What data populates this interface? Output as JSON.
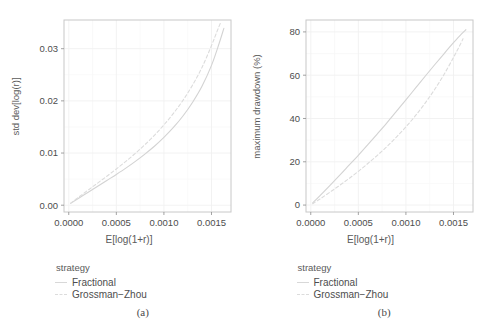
{
  "figure": {
    "background": "#ffffff",
    "line_color_solid": "#d3d3d3",
    "line_color_dashed": "#dcdcdc",
    "grid_color": "#f0f0f0",
    "panel_border_color": "#c8c8c8",
    "text_color": "#4a4a4a"
  },
  "panels": [
    {
      "caption": "(a)",
      "legend": {
        "title": "strategy",
        "items": [
          {
            "label": "Fractional",
            "style": "solid"
          },
          {
            "label": "Grossman−Zhou",
            "style": "dashed"
          }
        ]
      },
      "chart_data": {
        "type": "line",
        "title": "",
        "xlabel": "E[log(1+r)]",
        "ylabel": "std dev[log(r)]",
        "xlim": [
          -5e-05,
          0.001705
        ],
        "ylim": [
          -0.0013,
          0.0355
        ],
        "xticks": [
          0.0,
          0.0005,
          0.001,
          0.0015
        ],
        "xticklabels": [
          "0.0000",
          "0.0005",
          "0.0010",
          "0.0015"
        ],
        "yticks": [
          0.0,
          0.01,
          0.02,
          0.03
        ],
        "yticklabels": [
          "0.00",
          "0.01",
          "0.02",
          "0.03"
        ],
        "x_minor_ticks": [
          0.00025,
          0.00075,
          0.00125,
          0.00175
        ],
        "y_minor_ticks": [
          0.005,
          0.015,
          0.025
        ],
        "grid": true,
        "legend_position": "below",
        "series": [
          {
            "name": "Fractional",
            "style": "solid",
            "x": [
              2e-05,
              0.0001,
              0.0002,
              0.0003,
              0.0004,
              0.0005,
              0.0006,
              0.0007,
              0.0008,
              0.0009,
              0.001,
              0.0011,
              0.0012,
              0.0013,
              0.0014,
              0.0015,
              0.00158,
              0.00163
            ],
            "y": [
              0.00035,
              0.0013,
              0.00245,
              0.0036,
              0.00475,
              0.0059,
              0.0071,
              0.0084,
              0.0098,
              0.0113,
              0.013,
              0.0149,
              0.0171,
              0.0197,
              0.0228,
              0.0268,
              0.031,
              0.0339
            ]
          },
          {
            "name": "Grossman−Zhou",
            "style": "dashed",
            "x": [
              2e-05,
              0.0001,
              0.0002,
              0.0003,
              0.0004,
              0.0005,
              0.0006,
              0.0007,
              0.0008,
              0.0009,
              0.001,
              0.0011,
              0.0012,
              0.0013,
              0.0014,
              0.0015,
              0.00156,
              0.0016
            ],
            "y": [
              0.0004,
              0.0015,
              0.00285,
              0.0042,
              0.00555,
              0.00695,
              0.0084,
              0.00995,
              0.0116,
              0.0134,
              0.0154,
              0.0176,
              0.0201,
              0.023,
              0.0264,
              0.0306,
              0.0334,
              0.0352
            ]
          }
        ]
      }
    },
    {
      "caption": "(b)",
      "legend": {
        "title": "strategy",
        "items": [
          {
            "label": "Fractional",
            "style": "solid"
          },
          {
            "label": "Grossman−Zhou",
            "style": "dashed"
          }
        ]
      },
      "chart_data": {
        "type": "line",
        "title": "",
        "xlabel": "E[log(1+r)]",
        "ylabel": "maximum drawdown (%)",
        "xlim": [
          -5e-05,
          0.001705
        ],
        "ylim": [
          -3.2,
          85.5
        ],
        "xticks": [
          0.0,
          0.0005,
          0.001,
          0.0015
        ],
        "xticklabels": [
          "0.0000",
          "0.0005",
          "0.0010",
          "0.0015"
        ],
        "yticks": [
          0,
          20,
          40,
          60,
          80
        ],
        "yticklabels": [
          "0",
          "20",
          "40",
          "60",
          "80"
        ],
        "x_minor_ticks": [
          0.00025,
          0.00075,
          0.00125,
          0.00175
        ],
        "y_minor_ticks": [
          10,
          30,
          50,
          70
        ],
        "grid": true,
        "legend_position": "below",
        "series": [
          {
            "name": "Fractional",
            "style": "solid",
            "x": [
              2e-05,
              0.0001,
              0.0002,
              0.0003,
              0.0004,
              0.0005,
              0.0006,
              0.0007,
              0.0008,
              0.0009,
              0.001,
              0.0011,
              0.0012,
              0.0013,
              0.0014,
              0.0015,
              0.00158,
              0.00163
            ],
            "y": [
              1.0,
              4.5,
              9.0,
              13.6,
              18.3,
              23.0,
              27.9,
              32.9,
              38.0,
              43.3,
              48.6,
              54.0,
              59.4,
              64.7,
              69.9,
              75.0,
              78.9,
              81.0
            ]
          },
          {
            "name": "Grossman−Zhou",
            "style": "dashed",
            "x": [
              2e-05,
              0.0001,
              0.0002,
              0.0003,
              0.0004,
              0.0005,
              0.0006,
              0.0007,
              0.0008,
              0.0009,
              0.001,
              0.0011,
              0.0012,
              0.0013,
              0.0014,
              0.0015,
              0.00156,
              0.0016
            ],
            "y": [
              0.6,
              2.9,
              5.9,
              9.0,
              12.2,
              15.6,
              19.2,
              23.0,
              27.0,
              31.4,
              36.1,
              41.3,
              47.0,
              53.3,
              60.3,
              68.2,
              73.2,
              76.8
            ]
          }
        ]
      }
    }
  ]
}
